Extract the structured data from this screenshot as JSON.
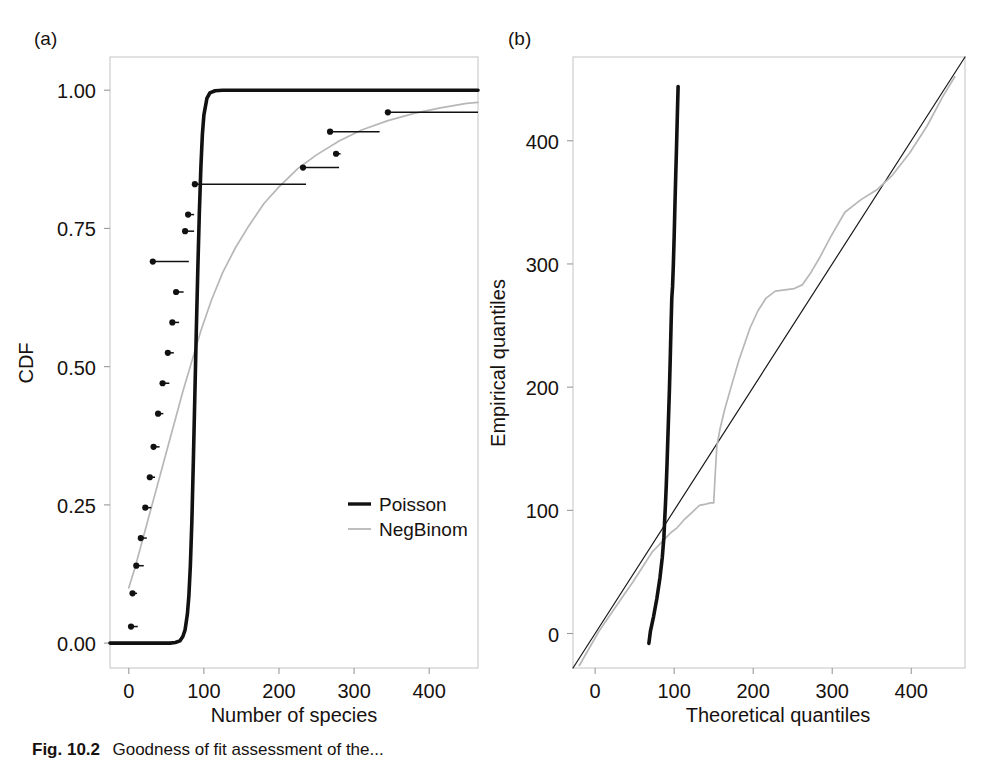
{
  "figure": {
    "caption_label": "Fig. 10.2",
    "caption_text": "Goodness of fit assessment of the...",
    "background": "#ffffff"
  },
  "colors": {
    "poisson": "#111111",
    "negbinom": "#b7b7b7",
    "frame": "#c9c9c9",
    "tick": "#9a9a9a",
    "reference_line": "#1a1a1a",
    "text": "#17120f"
  },
  "panels": [
    {
      "tag": "(a)",
      "xlabel": "Number of species",
      "ylabel": "CDF",
      "xticks": [
        0,
        100,
        200,
        300,
        400
      ],
      "yticks": [
        "0.00",
        "0.25",
        "0.50",
        "0.75",
        "1.00"
      ],
      "xlim": [
        -25,
        465
      ],
      "ylim": [
        -0.045,
        1.06
      ],
      "legend": [
        {
          "label": "Poisson",
          "color": "#111111"
        },
        {
          "label": "NegBinom",
          "color": "#b7b7b7"
        }
      ]
    },
    {
      "tag": "(b)",
      "xlabel": "Theoretical quantiles",
      "ylabel": "Empirical quantiles",
      "xticks": [
        0,
        100,
        200,
        300,
        400
      ],
      "yticks": [
        0,
        100,
        200,
        300,
        400
      ],
      "xlim": [
        -28,
        468
      ],
      "ylim": [
        -28,
        468
      ]
    }
  ],
  "chart_data": [
    {
      "type": "line",
      "title": "(a) Fitted CDFs versus empirical CDF",
      "xlabel": "Number of species",
      "ylabel": "CDF",
      "xlim": [
        -25,
        465
      ],
      "ylim": [
        -0.045,
        1.06
      ],
      "grid": false,
      "legend_position": "center-right",
      "series": [
        {
          "name": "Poisson",
          "color": "#111111",
          "style": "solid-thick",
          "x": [
            -25,
            0,
            20,
            40,
            55,
            62,
            68,
            72,
            75,
            78,
            80,
            82,
            84,
            86,
            88,
            90,
            92,
            94,
            96,
            98,
            100,
            104,
            108,
            115,
            125,
            145,
            180,
            240,
            320,
            400,
            465
          ],
          "y": [
            0.0,
            0.0,
            0.0,
            0.0,
            0.0,
            0.001,
            0.004,
            0.012,
            0.024,
            0.052,
            0.085,
            0.14,
            0.22,
            0.33,
            0.45,
            0.57,
            0.68,
            0.78,
            0.86,
            0.92,
            0.955,
            0.985,
            0.995,
            0.999,
            1.0,
            1.0,
            1.0,
            1.0,
            1.0,
            1.0,
            1.0
          ]
        },
        {
          "name": "NegBinom",
          "color": "#b7b7b7",
          "style": "solid-thin",
          "x": [
            0,
            8,
            16,
            24,
            32,
            42,
            52,
            62,
            72,
            84,
            96,
            110,
            125,
            142,
            160,
            180,
            200,
            225,
            250,
            280,
            310,
            345,
            380,
            415,
            450,
            465
          ],
          "y": [
            0.1,
            0.135,
            0.175,
            0.215,
            0.255,
            0.305,
            0.355,
            0.405,
            0.455,
            0.51,
            0.565,
            0.62,
            0.67,
            0.715,
            0.755,
            0.795,
            0.825,
            0.858,
            0.883,
            0.908,
            0.928,
            0.945,
            0.958,
            0.968,
            0.976,
            0.978
          ]
        }
      ],
      "empirical_steps": {
        "name": "Empirical CDF",
        "color": "#111111",
        "marker": "filled-circle",
        "points": [
          {
            "x": 3,
            "y": 0.03,
            "run": 9
          },
          {
            "x": 5,
            "y": 0.09,
            "run": 6
          },
          {
            "x": 10,
            "y": 0.14,
            "run": 10
          },
          {
            "x": 16,
            "y": 0.19,
            "run": 8
          },
          {
            "x": 22,
            "y": 0.245,
            "run": 8
          },
          {
            "x": 28,
            "y": 0.3,
            "run": 7
          },
          {
            "x": 33,
            "y": 0.355,
            "run": 8
          },
          {
            "x": 39,
            "y": 0.415,
            "run": 7
          },
          {
            "x": 45,
            "y": 0.47,
            "run": 9
          },
          {
            "x": 52,
            "y": 0.525,
            "run": 8
          },
          {
            "x": 58,
            "y": 0.58,
            "run": 9
          },
          {
            "x": 63,
            "y": 0.635,
            "run": 10
          },
          {
            "x": 32,
            "y": 0.69,
            "run": 48
          },
          {
            "x": 75,
            "y": 0.745,
            "run": 12
          },
          {
            "x": 79,
            "y": 0.775,
            "run": 8
          },
          {
            "x": 88,
            "y": 0.83,
            "run": 148
          },
          {
            "x": 232,
            "y": 0.86,
            "run": 48
          },
          {
            "x": 276,
            "y": 0.885,
            "run": 6
          },
          {
            "x": 268,
            "y": 0.925,
            "run": 66
          },
          {
            "x": 345,
            "y": 0.96,
            "run": 120
          }
        ]
      }
    },
    {
      "type": "line",
      "title": "(b) QQ plot of theoretical versus empirical quantiles",
      "xlabel": "Theoretical quantiles",
      "ylabel": "Empirical quantiles",
      "xlim": [
        -28,
        468
      ],
      "ylim": [
        -28,
        468
      ],
      "grid": false,
      "series": [
        {
          "name": "Reference line",
          "color": "#1a1a1a",
          "style": "solid-hairline",
          "x": [
            -28,
            468
          ],
          "y": [
            -28,
            468
          ]
        },
        {
          "name": "Poisson",
          "color": "#111111",
          "style": "solid-thick",
          "x": [
            68,
            70,
            74,
            78,
            82,
            85,
            87,
            88,
            89,
            90,
            91,
            92,
            93,
            94,
            95,
            96,
            97,
            98,
            99,
            100,
            101,
            102,
            103,
            104,
            105
          ],
          "y": [
            -8,
            2,
            14,
            28,
            45,
            62,
            78,
            92,
            105,
            120,
            138,
            158,
            178,
            198,
            222,
            248,
            272,
            282,
            300,
            322,
            348,
            372,
            395,
            420,
            444
          ]
        },
        {
          "name": "NegBinom",
          "color": "#b7b7b7",
          "style": "solid-thin",
          "x": [
            -20,
            5,
            20,
            35,
            48,
            58,
            66,
            72,
            78,
            84,
            90,
            96,
            104,
            112,
            122,
            132,
            140,
            146,
            150,
            152,
            154,
            158,
            164,
            172,
            182,
            196,
            206,
            216,
            228,
            240,
            252,
            262,
            272,
            284,
            298,
            316,
            336,
            356,
            376,
            398,
            420,
            440,
            455
          ],
          "y": [
            -26,
            2,
            16,
            30,
            42,
            52,
            60,
            66,
            70,
            74,
            78,
            82,
            86,
            92,
            98,
            104,
            105,
            106,
            106,
            130,
            152,
            166,
            182,
            200,
            222,
            248,
            262,
            272,
            278,
            279,
            280,
            283,
            292,
            305,
            322,
            342,
            352,
            360,
            372,
            390,
            412,
            436,
            452
          ]
        }
      ]
    }
  ]
}
